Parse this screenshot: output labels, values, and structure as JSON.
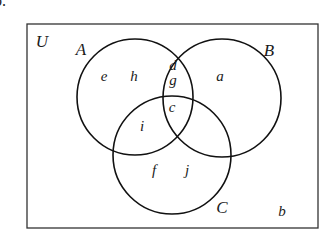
{
  "figure_label": "b.",
  "universe": {
    "label": "U",
    "rect": {
      "x": 27,
      "y": 24,
      "width": 291,
      "height": 204
    }
  },
  "sets": [
    {
      "name": "A",
      "label_pos": [
        81,
        51
      ],
      "circle": {
        "cx": 135,
        "cy": 97,
        "r": 58
      }
    },
    {
      "name": "B",
      "label_pos": [
        269,
        52
      ],
      "circle": {
        "cx": 222,
        "cy": 98,
        "r": 59
      }
    },
    {
      "name": "C",
      "label_pos": [
        222,
        209
      ],
      "circle": {
        "cx": 172,
        "cy": 155,
        "r": 59
      }
    }
  ],
  "elements": [
    {
      "name": "e",
      "region": "A only",
      "pos": [
        104,
        78
      ]
    },
    {
      "name": "h",
      "region": "A only",
      "pos": [
        134,
        78
      ]
    },
    {
      "name": "d",
      "region": "A ∩ B only",
      "pos": [
        173,
        67
      ]
    },
    {
      "name": "g",
      "region": "A ∩ B only",
      "pos": [
        173,
        82
      ]
    },
    {
      "name": "a",
      "region": "B only",
      "pos": [
        220,
        78
      ]
    },
    {
      "name": "c",
      "region": "A ∩ B ∩ C",
      "pos": [
        172,
        109
      ]
    },
    {
      "name": "i",
      "region": "A ∩ C only",
      "pos": [
        142,
        128
      ]
    },
    {
      "name": "f",
      "region": "C only",
      "pos": [
        154,
        172
      ]
    },
    {
      "name": "j",
      "region": "C only",
      "pos": [
        187,
        172
      ]
    },
    {
      "name": "b",
      "region": "outside all sets",
      "pos": [
        282,
        213
      ]
    }
  ],
  "colors": {
    "stroke": "#111111",
    "frame": "#333333",
    "text": "#1a1a1a",
    "background": "#ffffff"
  }
}
